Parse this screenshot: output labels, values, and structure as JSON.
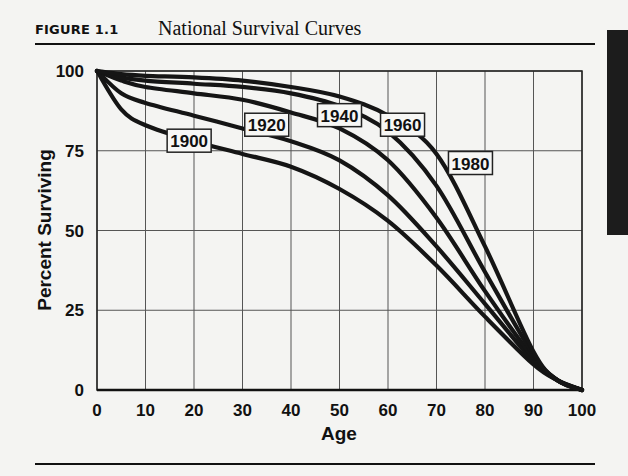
{
  "figure": {
    "label": "FIGURE 1.1",
    "title": "National Survival Curves"
  },
  "chart_data": {
    "type": "line",
    "title": "National Survival Curves",
    "xlabel": "Age",
    "ylabel": "Percent Surviving",
    "xlim": [
      0,
      100
    ],
    "ylim": [
      0,
      100
    ],
    "xticks": [
      0,
      10,
      20,
      30,
      40,
      50,
      60,
      70,
      80,
      90,
      100
    ],
    "yticks": [
      0,
      25,
      50,
      75,
      100
    ],
    "grid": true,
    "legend": "inline labels",
    "x": [
      0,
      5,
      10,
      20,
      30,
      40,
      50,
      60,
      70,
      80,
      90,
      95,
      100
    ],
    "series": [
      {
        "name": "1900",
        "values": [
          100,
          88,
          83,
          78,
          74,
          70,
          63,
          53,
          39,
          23,
          8,
          3,
          0
        ],
        "label_pos": [
          19,
          78
        ]
      },
      {
        "name": "1920",
        "values": [
          100,
          93,
          90,
          86,
          82,
          78,
          72,
          61,
          45,
          27,
          9,
          3,
          0
        ],
        "label_pos": [
          35,
          83
        ]
      },
      {
        "name": "1940",
        "values": [
          100,
          97,
          95,
          93,
          91,
          87,
          82,
          72,
          54,
          31,
          10,
          3,
          0
        ],
        "label_pos": [
          50,
          86
        ]
      },
      {
        "name": "1960",
        "values": [
          100,
          98,
          97,
          96,
          95,
          93,
          89,
          81,
          64,
          37,
          11,
          3,
          0
        ],
        "label_pos": [
          63,
          83
        ]
      },
      {
        "name": "1980",
        "values": [
          100,
          99,
          98.5,
          98,
          97,
          95,
          92,
          86,
          74,
          45,
          12,
          3,
          0
        ],
        "label_pos": [
          77,
          71
        ]
      }
    ]
  }
}
